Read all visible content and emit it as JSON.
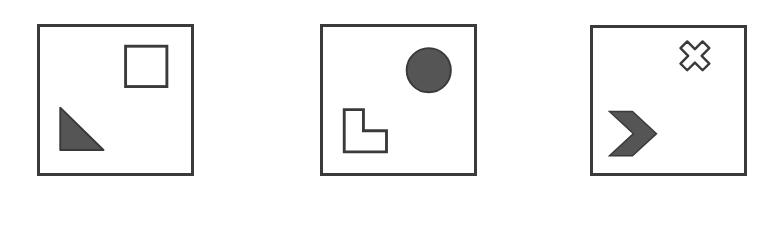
{
  "figure": {
    "type": "shape-panels",
    "colors": {
      "stroke": "#3a3a3a",
      "fill": "#555555",
      "background": "#ffffff"
    },
    "panels": [
      {
        "index": 1,
        "box": {
          "x": 37,
          "y": 24,
          "w": 157,
          "h": 152
        },
        "shapes": [
          {
            "name": "square",
            "style": "outline",
            "position": "top-right"
          },
          {
            "name": "right-triangle",
            "style": "filled",
            "position": "bottom-left"
          }
        ]
      },
      {
        "index": 2,
        "box": {
          "x": 320,
          "y": 24,
          "w": 157,
          "h": 152
        },
        "shapes": [
          {
            "name": "circle",
            "style": "filled",
            "position": "top-right"
          },
          {
            "name": "l-shape",
            "style": "outline",
            "position": "bottom-left"
          }
        ]
      },
      {
        "index": 3,
        "box": {
          "x": 590,
          "y": 25,
          "w": 157,
          "h": 151
        },
        "shapes": [
          {
            "name": "cross-x",
            "style": "outline",
            "position": "top-right"
          },
          {
            "name": "chevron-right",
            "style": "filled",
            "position": "bottom-left"
          }
        ]
      }
    ]
  }
}
